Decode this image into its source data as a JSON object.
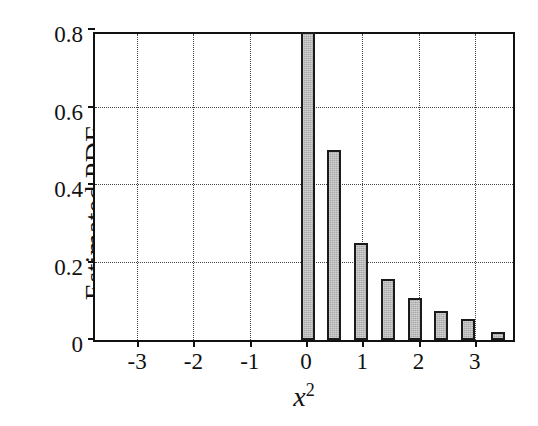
{
  "chart_data": {
    "type": "bar",
    "title": "",
    "subtitle": "",
    "xlabel": "x^2",
    "xlabel_base": "x",
    "xlabel_exponent": "2",
    "ylabel": "Estimated PDF",
    "xlim": [
      -3.75,
      3.75
    ],
    "ylim": [
      0,
      0.8
    ],
    "grid": true,
    "legend": null,
    "x_ticks": [
      -3,
      -2,
      -1,
      0,
      1,
      2,
      3
    ],
    "x_tick_labels": [
      "-3",
      "-2",
      "-1",
      "0",
      "1",
      "2",
      "3"
    ],
    "y_ticks": [
      0,
      0.2,
      0.4,
      0.6,
      0.8
    ],
    "y_tick_labels": [
      "0",
      "0.2",
      "0.4",
      "0.6",
      "0.8"
    ],
    "bar_width": 0.25,
    "bar_face_color": "#a9a9a9",
    "bar_edge_color": "#1a1a1a",
    "grid_color": "#444444",
    "axis_color": "#111111",
    "background_color": "#ffffff",
    "x": [
      0.03,
      0.5,
      0.98,
      1.45,
      1.93,
      2.4,
      2.88,
      3.42
    ],
    "categories": [
      "0.03",
      "0.50",
      "0.98",
      "1.45",
      "1.93",
      "2.40",
      "2.88",
      "3.42"
    ],
    "values": [
      0.795,
      0.49,
      0.25,
      0.157,
      0.108,
      0.075,
      0.054,
      0.021
    ],
    "bars": [
      {
        "center": 0.03,
        "value": 0.795
      },
      {
        "center": 0.5,
        "value": 0.49
      },
      {
        "center": 0.98,
        "value": 0.25
      },
      {
        "center": 1.45,
        "value": 0.157
      },
      {
        "center": 1.93,
        "value": 0.108
      },
      {
        "center": 2.4,
        "value": 0.075
      },
      {
        "center": 2.88,
        "value": 0.054
      },
      {
        "center": 3.42,
        "value": 0.021
      }
    ]
  }
}
